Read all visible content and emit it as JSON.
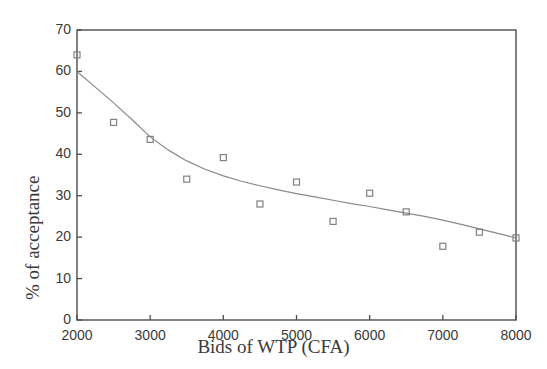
{
  "chart_data": {
    "type": "scatter",
    "title": "",
    "xlabel": "Bids of WTP (CFA)",
    "ylabel": "% of acceptance",
    "xlim": [
      2000,
      8000
    ],
    "ylim": [
      0,
      70
    ],
    "xticks": [
      "2000",
      "3000",
      "4000",
      "5000",
      "6000",
      "7000",
      "8000"
    ],
    "xtick_values": [
      2000,
      3000,
      4000,
      5000,
      6000,
      7000,
      8000
    ],
    "yticks": [
      "0",
      "10",
      "20",
      "30",
      "40",
      "50",
      "60",
      "70"
    ],
    "ytick_values": [
      0,
      10,
      20,
      30,
      40,
      50,
      60,
      70
    ],
    "grid": false,
    "legend": false,
    "frame": true,
    "marker": "open-square",
    "marker_color": "#808080",
    "line_color": "#8a8a8a",
    "axis_color": "#4d4d4d",
    "background": "#ffffff",
    "x": [
      2000,
      2500,
      3000,
      3500,
      4000,
      4500,
      5000,
      5500,
      6000,
      6500,
      7000,
      7500,
      8000
    ],
    "values": [
      64.0,
      47.7,
      43.6,
      34.0,
      39.2,
      28.0,
      33.3,
      23.8,
      30.6,
      26.1,
      17.8,
      21.2,
      19.8
    ],
    "series": [
      {
        "name": "Observed % of acceptance",
        "type": "scatter",
        "x": [
          2000,
          2500,
          3000,
          3500,
          4000,
          4500,
          5000,
          5500,
          6000,
          6500,
          7000,
          7500,
          8000
        ],
        "values": [
          64.0,
          47.7,
          43.6,
          34.0,
          39.2,
          28.0,
          33.3,
          23.8,
          30.6,
          26.1,
          17.8,
          21.2,
          19.8
        ]
      },
      {
        "name": "Fitted curve",
        "type": "line",
        "x": [
          2000,
          2250,
          2500,
          2750,
          3000,
          3250,
          3500,
          3750,
          4000,
          4250,
          4500,
          4750,
          5000,
          5250,
          5500,
          5750,
          6000,
          6250,
          6500,
          6750,
          7000,
          7250,
          7500,
          7750,
          8000
        ],
        "values": [
          60.0,
          56.2,
          52.4,
          48.4,
          44.2,
          41.0,
          38.4,
          36.4,
          34.8,
          33.5,
          32.4,
          31.4,
          30.5,
          29.7,
          28.9,
          28.1,
          27.4,
          26.6,
          25.8,
          25.0,
          24.1,
          23.1,
          22.0,
          20.9,
          19.8
        ]
      }
    ]
  }
}
